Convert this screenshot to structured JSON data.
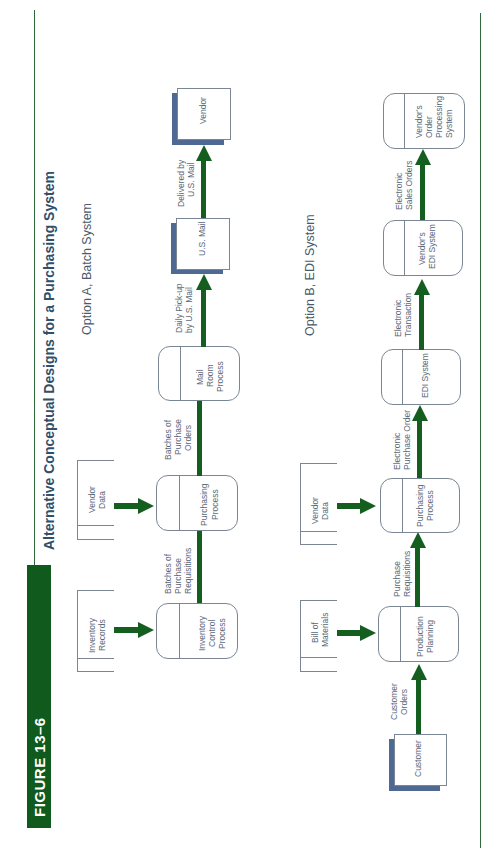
{
  "figure": {
    "tag": "FIGURE 13–6",
    "title": "Alternative Conceptual Designs for a Purchasing System"
  },
  "colors": {
    "accent_green": "#145e20",
    "tag_green": "#0f5a1c",
    "shadow_blue": "#4f6a92",
    "title_blue": "#2f4f6b"
  },
  "option_a": {
    "title": "Option A, Batch System",
    "stores": [
      {
        "label_1": "Inventory",
        "label_2": "Records"
      },
      {
        "label_1": "Vendor",
        "label_2": "Data"
      }
    ],
    "processes": [
      {
        "label_1": "Inventory",
        "label_2": "Control",
        "label_3": "Process"
      },
      {
        "label_1": "Purchasing",
        "label_2": "Process"
      },
      {
        "label_1": "Mail",
        "label_2": "Room",
        "label_3": "Process"
      }
    ],
    "externals": [
      {
        "label": "U.S. Mail"
      },
      {
        "label_1": "Vendor"
      }
    ],
    "flows": [
      {
        "line_1": "Batches of",
        "line_2": "Purchase",
        "line_3": "Requisitions"
      },
      {
        "line_1": "Batches of",
        "line_2": "Purchase",
        "line_3": "Orders"
      },
      {
        "line_1": "Daily Pick-up",
        "line_2": "by U.S. Mail"
      },
      {
        "line_1": "Delivered by",
        "line_2": "U.S. Mail"
      }
    ]
  },
  "option_b": {
    "title": "Option B, EDI System",
    "stores": [
      {
        "label_1": "Bill of",
        "label_2": "Materials"
      },
      {
        "label_1": "Vendor",
        "label_2": "Data"
      }
    ],
    "externals": [
      {
        "label": "Customer"
      }
    ],
    "processes": [
      {
        "label_1": "Production",
        "label_2": "Planning"
      },
      {
        "label_1": "Purchasing",
        "label_2": "Process"
      },
      {
        "label_1": "EDI System"
      },
      {
        "label_1": "Vendor's",
        "label_2": "EDI System"
      },
      {
        "label_1": "Vendor's",
        "label_2": "Order",
        "label_3": "Processing",
        "label_4": "System"
      }
    ],
    "flows": [
      {
        "line_1": "Customer",
        "line_2": "Orders"
      },
      {
        "line_1": "Purchase",
        "line_2": "Requisitions"
      },
      {
        "line_1": "Electronic",
        "line_2": "Purchase Order"
      },
      {
        "line_1": "Electronic",
        "line_2": "Transaction"
      },
      {
        "line_1": "Electronic",
        "line_2": "Sales Orders"
      }
    ]
  }
}
